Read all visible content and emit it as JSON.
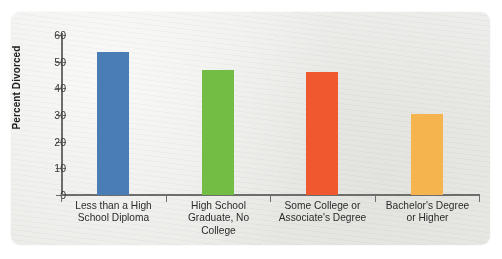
{
  "chart_data": {
    "type": "bar",
    "title": "",
    "subtitle": "",
    "xlabel": "",
    "ylabel": "Percent Divorced",
    "ylim": [
      0,
      60
    ],
    "yticks": [
      0,
      10,
      20,
      30,
      40,
      50,
      60
    ],
    "grid": false,
    "legend": "none",
    "categories": [
      "Less than a High School Diploma",
      "High School Graduate, No College",
      "Some College or Associate's Degree",
      "Bachelor's Degree or Higher"
    ],
    "category_lines": [
      [
        "Less than a High",
        "School Diploma"
      ],
      [
        "High School",
        "Graduate, No",
        "College"
      ],
      [
        "Some College or",
        "Associate's Degree"
      ],
      [
        "Bachelor's Degree",
        "or Higher"
      ]
    ],
    "values": [
      53.5,
      47,
      46,
      30.5
    ],
    "bar_colors": [
      "#4a7cb5",
      "#74bd45",
      "#f0592f",
      "#f5b44e"
    ]
  },
  "colors": {
    "card_background": "#eaeae7",
    "page_background": "#ffffff",
    "axis": "#6d6d6d",
    "tick_text": "#3a3a3a",
    "axis_title": "#1d1d1d",
    "category_text": "#2b2b2b"
  }
}
